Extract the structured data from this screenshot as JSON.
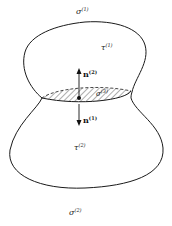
{
  "diagram": {
    "labels": {
      "sigma1": {
        "base": "σ",
        "sup": "(1)"
      },
      "tau1": {
        "base": "τ",
        "sup": "(1)"
      },
      "n2": {
        "base": "n",
        "sup": "(2)"
      },
      "sigma3": {
        "base": "σ",
        "sup": "(3)"
      },
      "n1": {
        "base": "n",
        "sup": "(1)"
      },
      "tau2": {
        "base": "τ",
        "sup": "(2)"
      },
      "sigma2": {
        "base": "σ",
        "sup": "(2)"
      }
    },
    "colors": {
      "stroke": "#1a1a1a",
      "hatch": "#333333",
      "background": "#ffffff"
    }
  }
}
